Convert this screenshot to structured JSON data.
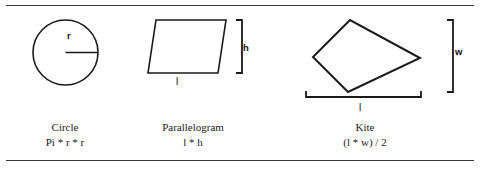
{
  "page": {
    "background_color": "#ffffff",
    "line_color": "#1a1a1a",
    "rule_color": "#3a3a3a"
  },
  "figures": [
    {
      "id": "circle",
      "shape": "circle",
      "caption_name": "Circle",
      "caption_formula": "Pi * r * r",
      "dimension_labels": [
        {
          "text": "r",
          "describes": "radius"
        }
      ]
    },
    {
      "id": "parallelogram",
      "shape": "parallelogram",
      "caption_name": "Parallelogram",
      "caption_formula": "l * h",
      "dimension_labels": [
        {
          "text": "h",
          "describes": "height"
        },
        {
          "text": "l",
          "describes": "length"
        }
      ]
    },
    {
      "id": "kite",
      "shape": "kite",
      "caption_name": "Kite",
      "caption_formula": "(l * w) / 2",
      "dimension_labels": [
        {
          "text": "w",
          "describes": "width"
        },
        {
          "text": "l",
          "describes": "length"
        }
      ]
    }
  ]
}
